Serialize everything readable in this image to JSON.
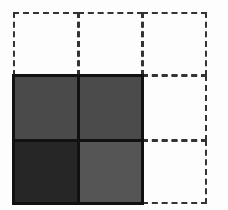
{
  "diagram": {
    "grid": {
      "columns": 3,
      "rows": 3,
      "col_edges": [
        13,
        78,
        142,
        206
      ],
      "row_edges": [
        12,
        75,
        140,
        203
      ]
    },
    "cells": [
      {
        "row": 0,
        "col": 0,
        "filled": false
      },
      {
        "row": 0,
        "col": 1,
        "filled": false
      },
      {
        "row": 0,
        "col": 2,
        "filled": false
      },
      {
        "row": 1,
        "col": 0,
        "filled": true,
        "color": "#4a4a4a"
      },
      {
        "row": 1,
        "col": 1,
        "filled": true,
        "color": "#4b4b4b"
      },
      {
        "row": 1,
        "col": 2,
        "filled": false
      },
      {
        "row": 2,
        "col": 0,
        "filled": true,
        "color": "#262626"
      },
      {
        "row": 2,
        "col": 1,
        "filled": true,
        "color": "#555555"
      },
      {
        "row": 2,
        "col": 2,
        "filled": false
      }
    ],
    "colors": {
      "dashed_border": "#333333",
      "solid_border": "#111111",
      "background": "#fdfdfd"
    }
  }
}
